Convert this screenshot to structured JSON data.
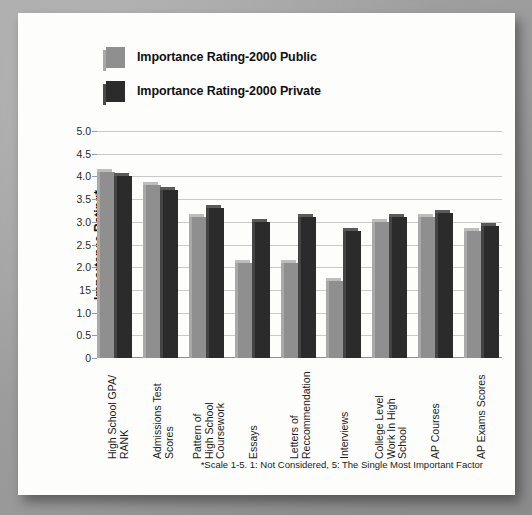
{
  "legend": {
    "items": [
      {
        "label": "Importance Rating-2000 Public",
        "swatch": "light-gray-square-icon",
        "color": "#8f8f8f"
      },
      {
        "label": "Importance Rating-2000 Private",
        "swatch": "dark-gray-square-icon",
        "color": "#2b2b2b"
      }
    ]
  },
  "footnote": "*Scale 1-5. 1: Not Considered, 5: The Single Most Important Factor",
  "chart_data": {
    "type": "bar",
    "title": "",
    "xlabel": "",
    "ylabel": "Importance Rating*",
    "ylim": [
      0,
      5
    ],
    "grid": true,
    "legend_position": "top-left",
    "ytick_labels": [
      "5.0",
      "4.5",
      "4.0",
      "3.5",
      "3.0",
      "2.5",
      "2.0",
      "15",
      "1.0",
      "0.5",
      "0"
    ],
    "ytick_values": [
      5.0,
      4.5,
      4.0,
      3.5,
      3.0,
      2.5,
      2.0,
      1.5,
      1.0,
      0.5,
      0
    ],
    "categories": [
      "High School GPA/ RANK",
      "Admissions Test Scores",
      "Pattern of High School Coursework",
      "Essays",
      "Letters of Reccommendation",
      "Interviews",
      "College Level Work In High School",
      "AP Courses",
      "AP Exams Scores"
    ],
    "category_lines": [
      [
        "High School GPA/",
        "RANK"
      ],
      [
        "Admissions Test",
        "Scores"
      ],
      [
        "Pattern of",
        "High School",
        "Coursework"
      ],
      [
        "Essays"
      ],
      [
        "Letters of",
        "Reccommendation"
      ],
      [
        "Interviews"
      ],
      [
        "College Level",
        "Work In High",
        "School"
      ],
      [
        "AP Courses"
      ],
      [
        "AP Exams Scores"
      ]
    ],
    "series": [
      {
        "name": "Importance Rating-2000 Public",
        "color": "#8f8f8f",
        "values": [
          4.1,
          3.8,
          3.1,
          2.1,
          2.1,
          1.7,
          3.0,
          3.1,
          2.8
        ]
      },
      {
        "name": "Importance Rating-2000 Private",
        "color": "#2b2b2b",
        "values": [
          4.0,
          3.7,
          3.3,
          3.0,
          3.1,
          2.8,
          3.1,
          3.2,
          2.9
        ]
      }
    ]
  }
}
